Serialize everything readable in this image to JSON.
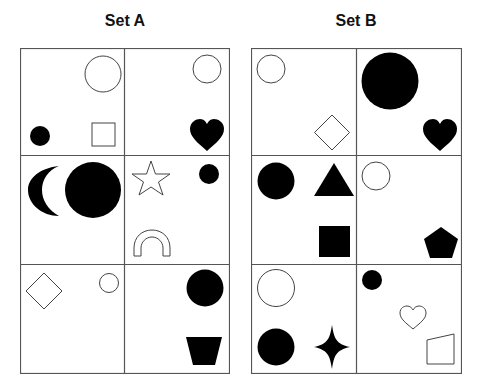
{
  "titles": {
    "set_a": "Set A",
    "set_b": "Set B"
  },
  "colors": {
    "line": "#555555",
    "fill": "#000000",
    "background": "#ffffff"
  },
  "set_a": {
    "cells": [
      {
        "row": 1,
        "col": 1,
        "shapes": [
          "outline circle (large)",
          "black circle (small)",
          "outline square"
        ]
      },
      {
        "row": 1,
        "col": 2,
        "shapes": [
          "outline circle",
          "black heart"
        ]
      },
      {
        "row": 2,
        "col": 1,
        "shapes": [
          "black crescent moon",
          "black circle (large)"
        ]
      },
      {
        "row": 2,
        "col": 2,
        "shapes": [
          "outline star",
          "black circle (small)",
          "outline arch/rainbow"
        ]
      },
      {
        "row": 3,
        "col": 1,
        "shapes": [
          "outline diamond",
          "outline circle (small)"
        ]
      },
      {
        "row": 3,
        "col": 2,
        "shapes": [
          "black circle",
          "black trapezoid"
        ]
      }
    ]
  },
  "set_b": {
    "cells": [
      {
        "row": 1,
        "col": 1,
        "shapes": [
          "outline circle",
          "outline diamond"
        ]
      },
      {
        "row": 1,
        "col": 2,
        "shapes": [
          "black circle (large)",
          "black heart"
        ]
      },
      {
        "row": 2,
        "col": 1,
        "shapes": [
          "black circle",
          "black triangle",
          "black square"
        ]
      },
      {
        "row": 2,
        "col": 2,
        "shapes": [
          "outline circle",
          "black pentagon"
        ]
      },
      {
        "row": 3,
        "col": 1,
        "shapes": [
          "outline circle",
          "black circle",
          "black four-point star"
        ]
      },
      {
        "row": 3,
        "col": 2,
        "shapes": [
          "black circle (small)",
          "outline heart",
          "outline quadrilateral"
        ]
      }
    ]
  }
}
